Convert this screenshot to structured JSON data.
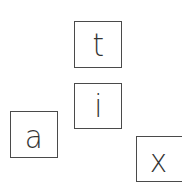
{
  "tiles": [
    {
      "letter": "t",
      "x": 74,
      "y": 21,
      "w": 48,
      "h": 47
    },
    {
      "letter": "i",
      "x": 74,
      "y": 83,
      "w": 48,
      "h": 46
    },
    {
      "letter": "a",
      "x": 10,
      "y": 111,
      "w": 48,
      "h": 47
    },
    {
      "letter": "x",
      "x": 136,
      "y": 136,
      "w": 50,
      "h": 46
    }
  ],
  "colors": {
    "background": "#ffffff",
    "border": "#4a4a4a",
    "text": "#333333"
  }
}
